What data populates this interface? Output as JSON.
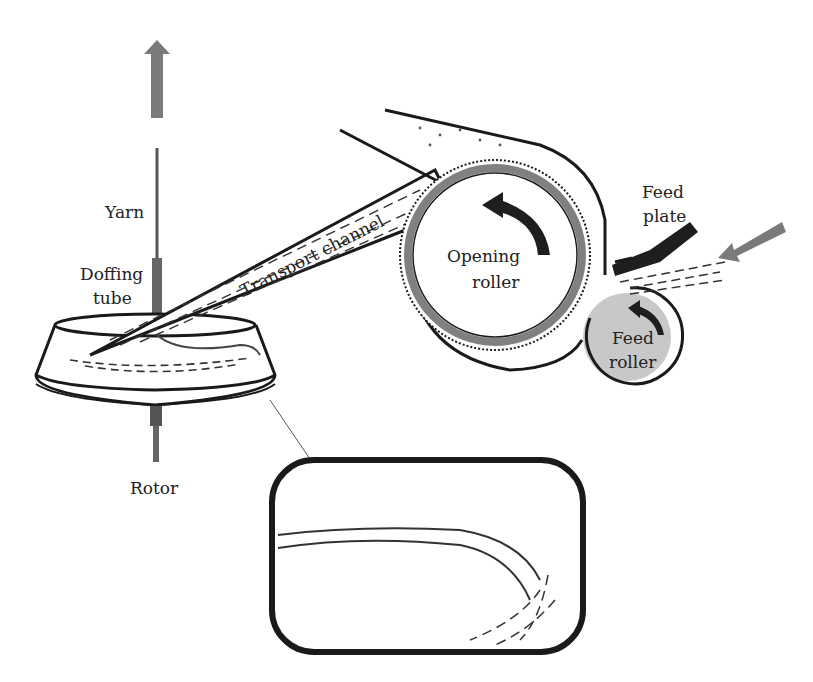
{
  "diagram": {
    "labels": {
      "yarn": "Yarn",
      "doffing_tube_line1": "Doffing",
      "doffing_tube_line2": "tube",
      "rotor": "Rotor",
      "transport_channel": "Transport channel",
      "opening_roller_line1": "Opening",
      "opening_roller_line2": "roller",
      "feed_plate_line1": "Feed",
      "feed_plate_line2": "plate",
      "feed_roller_line1": "Feed",
      "feed_roller_line2": "roller"
    },
    "colors": {
      "outline": "#1a1a1a",
      "arrow_gray": "#7a7a7a",
      "roller_ring": "#808080",
      "feed_roller_fill": "#c8c8c8",
      "dark_arrow": "#1e1e1e"
    }
  }
}
